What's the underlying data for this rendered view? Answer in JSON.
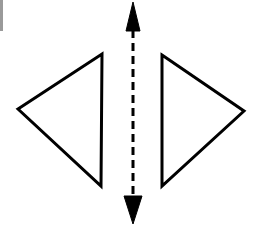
{
  "figure": {
    "title": "Mirror symmetry diagram",
    "width": 268,
    "height": 227,
    "background_color": "#ffffff",
    "stroke_color": "#000000",
    "edge_marker_color": "#9a9a9a"
  },
  "shapes": {
    "left_triangle": {
      "name": "left-triangle",
      "orientation": "points-left",
      "fill": "none",
      "stroke": "#000000",
      "stroke_width": 3,
      "points": "18,109 102,54 101,186",
      "vertices": [
        {
          "label": "left-apex",
          "x": 18,
          "y": 109
        },
        {
          "label": "top-right",
          "x": 102,
          "y": 54
        },
        {
          "label": "bottom-right",
          "x": 101,
          "y": 186
        }
      ]
    },
    "right_triangle": {
      "name": "right-triangle",
      "orientation": "points-right",
      "fill": "none",
      "stroke": "#000000",
      "stroke_width": 3,
      "points": "162,55 244,111 162,186",
      "vertices": [
        {
          "label": "top-left",
          "x": 162,
          "y": 55
        },
        {
          "label": "right-apex",
          "x": 244,
          "y": 111
        },
        {
          "label": "bottom-left",
          "x": 162,
          "y": 186
        }
      ]
    }
  },
  "symmetry_axis": {
    "name": "vertical-dashed-double-arrow",
    "x": 133,
    "y_top": 2,
    "y_bottom": 224,
    "stroke": "#000000",
    "stroke_width": 3,
    "dash_pattern": "8 5",
    "line_y_start": 30,
    "line_y_end": 197,
    "arrow_head_top": {
      "name": "arrow-head-up",
      "points": "133,2 140,31 126,31",
      "tip_x": 133,
      "tip_y": 2,
      "base_y": 31,
      "half_width": 7
    },
    "arrow_head_bottom": {
      "name": "arrow-head-down",
      "points": "133,224 142,196 124,196",
      "tip_x": 133,
      "tip_y": 224,
      "base_y": 196,
      "half_width": 9
    }
  },
  "edge_marker": {
    "name": "left-edge-scan-artifact",
    "x": 0,
    "y": 0,
    "width": 3,
    "height": 31,
    "color": "#9a9a9a"
  },
  "chart_data": {
    "type": "diagram",
    "title": "Mirror symmetry diagram",
    "elements": [
      {
        "kind": "triangle",
        "name": "left-triangle",
        "points": [
          [
            18,
            109
          ],
          [
            102,
            54
          ],
          [
            101,
            186
          ]
        ]
      },
      {
        "kind": "triangle",
        "name": "right-triangle",
        "points": [
          [
            162,
            55
          ],
          [
            244,
            111
          ],
          [
            162,
            186
          ]
        ]
      },
      {
        "kind": "dashed-double-arrow",
        "name": "symmetry-axis",
        "from": [
          133,
          2
        ],
        "to": [
          133,
          224
        ]
      }
    ]
  }
}
